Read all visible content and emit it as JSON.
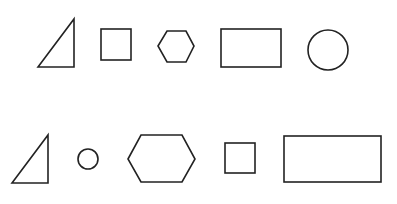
{
  "canvas": {
    "width": 397,
    "height": 204,
    "background": "#ffffff",
    "stroke": "#222222",
    "stroke_width": 1.6
  },
  "rows": [
    {
      "name": "row-1",
      "shapes": [
        {
          "type": "right-triangle",
          "points": "38,67 74,19 74,67"
        },
        {
          "type": "square",
          "x": 101,
          "y": 29,
          "w": 30,
          "h": 31
        },
        {
          "type": "hexagon",
          "points": "158,46 167,31 186,31 194,46 186,62 167,62"
        },
        {
          "type": "rectangle",
          "x": 221,
          "y": 29,
          "w": 60,
          "h": 38
        },
        {
          "type": "circle",
          "cx": 328,
          "cy": 50,
          "r": 20
        }
      ]
    },
    {
      "name": "row-2",
      "shapes": [
        {
          "type": "right-triangle",
          "points": "12,183 48,135 48,183"
        },
        {
          "type": "circle",
          "cx": 88,
          "cy": 159,
          "r": 10
        },
        {
          "type": "hexagon",
          "points": "128,159 141,135 182,135 195,159 182,182 141,182"
        },
        {
          "type": "square",
          "x": 225,
          "y": 143,
          "w": 30,
          "h": 30
        },
        {
          "type": "rectangle",
          "x": 284,
          "y": 136,
          "w": 97,
          "h": 46
        }
      ]
    }
  ]
}
